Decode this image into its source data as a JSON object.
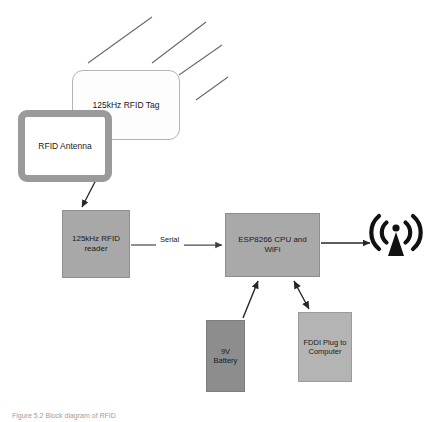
{
  "figure": {
    "caption": "Figure 5.2  Block diagram of RFID",
    "background_color": "#ffffff"
  },
  "nodes": {
    "tag": {
      "label": "125kHz RFID Tag",
      "fill": "#fdfdfd",
      "stroke": "#b4b4b4",
      "shape": "rounded-rectangle"
    },
    "antenna": {
      "label": "RFID Antenna",
      "fill": "#ffffff",
      "stroke": "#9a9a9a",
      "shape": "thick-framed-rounded-rectangle"
    },
    "reader": {
      "label": "125kHz RFID\nreader",
      "fill": "#a8a8a8",
      "stroke": "#8f8f8f",
      "shape": "rectangle"
    },
    "cpu": {
      "label": "ESP8266 CPU and\nWiFi",
      "fill": "#a9a9a9",
      "stroke": "#8d8d8d",
      "shape": "rectangle"
    },
    "battery": {
      "label": "9V\nBattery",
      "fill": "#8d8d8d",
      "stroke": "#7d7d7d",
      "shape": "rectangle"
    },
    "fddi": {
      "label": "FDDI Plug to\nComputer",
      "fill": "#b4b4b4",
      "stroke": "#9b9b9b",
      "shape": "rectangle"
    }
  },
  "edges": {
    "antenna_to_reader": {
      "label": "",
      "arrowheads": "single",
      "color": "#262626"
    },
    "reader_to_cpu": {
      "label": "Serial",
      "arrowheads": "single",
      "color": "#5a5a5a"
    },
    "cpu_to_wifi": {
      "label": "",
      "arrowheads": "single",
      "color": "#262626"
    },
    "battery_to_cpu": {
      "label": "",
      "arrowheads": "single",
      "color": "#262626"
    },
    "cpu_to_fddi": {
      "label": "",
      "arrowheads": "double",
      "color": "#262626"
    }
  },
  "decorations": {
    "radio_wave_lines": {
      "count": 4,
      "color": "#6b6b6b",
      "description": "parallel diagonal strokes above the RFID tag"
    },
    "wifi_icon": {
      "name": "wifi-broadcast-icon",
      "color": "#111111"
    }
  }
}
